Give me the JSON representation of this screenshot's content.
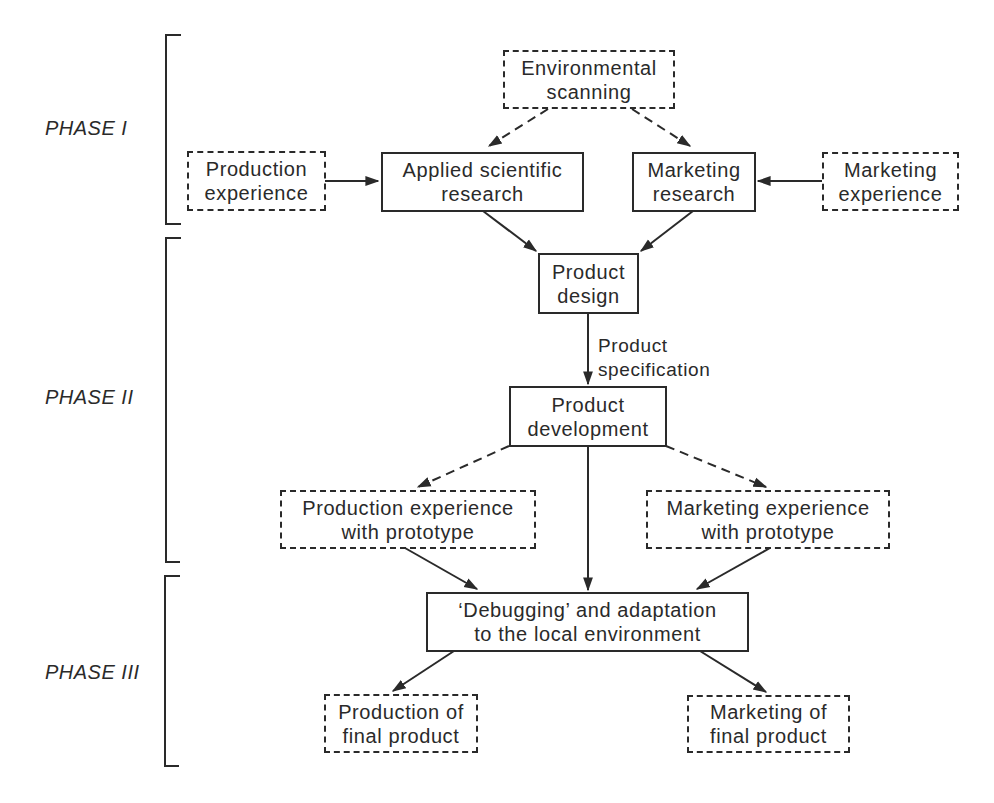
{
  "diagram": {
    "phases": [
      {
        "id": "phase-1",
        "label": "PHASE I"
      },
      {
        "id": "phase-2",
        "label": "PHASE II"
      },
      {
        "id": "phase-3",
        "label": "PHASE III"
      }
    ],
    "nodes": {
      "environmental_scanning": {
        "line1": "Environmental",
        "line2": "scanning",
        "style": "dashed"
      },
      "production_experience": {
        "line1": "Production",
        "line2": "experience",
        "style": "dashed"
      },
      "applied_research": {
        "line1": "Applied scientific",
        "line2": "research",
        "style": "solid"
      },
      "marketing_research": {
        "line1": "Marketing",
        "line2": "research",
        "style": "solid"
      },
      "marketing_experience": {
        "line1": "Marketing",
        "line2": "experience",
        "style": "dashed"
      },
      "product_design": {
        "line1": "Product",
        "line2": "design",
        "style": "solid"
      },
      "product_development": {
        "line1": "Product",
        "line2": "development",
        "style": "solid"
      },
      "production_exp_prototype": {
        "line1": "Production experience",
        "line2": "with prototype",
        "style": "dashed"
      },
      "marketing_exp_prototype": {
        "line1": "Marketing experience",
        "line2": "with prototype",
        "style": "dashed"
      },
      "debugging": {
        "line1": "‘Debugging’ and adaptation",
        "line2": "to the local environment",
        "style": "solid"
      },
      "production_final": {
        "line1": "Production of",
        "line2": "final product",
        "style": "dashed"
      },
      "marketing_final": {
        "line1": "Marketing of",
        "line2": "final product",
        "style": "dashed"
      }
    },
    "edge_labels": {
      "design_to_development": {
        "line1": "Product",
        "line2": "specification"
      }
    },
    "edges": [
      {
        "from": "environmental_scanning",
        "to": "applied_research",
        "style": "dashed"
      },
      {
        "from": "environmental_scanning",
        "to": "marketing_research",
        "style": "dashed"
      },
      {
        "from": "production_experience",
        "to": "applied_research",
        "style": "solid"
      },
      {
        "from": "marketing_experience",
        "to": "marketing_research",
        "style": "solid"
      },
      {
        "from": "applied_research",
        "to": "product_design",
        "style": "solid"
      },
      {
        "from": "marketing_research",
        "to": "product_design",
        "style": "solid"
      },
      {
        "from": "product_design",
        "to": "product_development",
        "style": "solid",
        "label": "Product specification"
      },
      {
        "from": "product_development",
        "to": "production_exp_prototype",
        "style": "dashed"
      },
      {
        "from": "product_development",
        "to": "marketing_exp_prototype",
        "style": "dashed"
      },
      {
        "from": "product_development",
        "to": "debugging",
        "style": "solid"
      },
      {
        "from": "production_exp_prototype",
        "to": "debugging",
        "style": "solid"
      },
      {
        "from": "marketing_exp_prototype",
        "to": "debugging",
        "style": "solid"
      },
      {
        "from": "debugging",
        "to": "production_final",
        "style": "solid"
      },
      {
        "from": "debugging",
        "to": "marketing_final",
        "style": "solid"
      }
    ],
    "colors": {
      "ink": "#2a2a2a",
      "background": "#ffffff"
    }
  }
}
